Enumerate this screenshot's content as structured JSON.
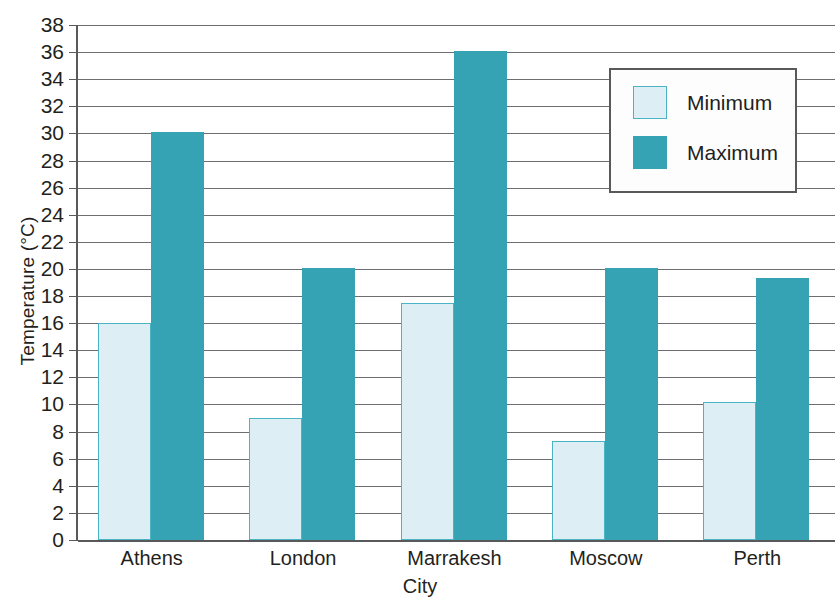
{
  "chart_data": {
    "type": "bar",
    "title": "",
    "xlabel": "City",
    "ylabel": "Temperature (°C)",
    "categories": [
      "Athens",
      "London",
      "Marrakesh",
      "Moscow",
      "Perth"
    ],
    "series": [
      {
        "name": "Minimum",
        "color": "#ddeff4",
        "border_color": "#4bb3c4",
        "values": [
          16.0,
          9.0,
          17.5,
          7.3,
          10.2
        ]
      },
      {
        "name": "Maximum",
        "color": "#36a3b5",
        "border_color": "#36a3b5",
        "values": [
          30.1,
          20.1,
          36.1,
          20.1,
          19.3
        ]
      }
    ],
    "ylim": [
      0,
      38
    ],
    "ytick_step": 2,
    "yticks": [
      0,
      2,
      4,
      6,
      8,
      10,
      12,
      14,
      16,
      18,
      20,
      22,
      24,
      26,
      28,
      30,
      32,
      34,
      36,
      38
    ],
    "grid": true,
    "legend_position": "upper-right",
    "legend_entries": [
      "Minimum",
      "Maximum"
    ]
  },
  "axes": {
    "y_title": "Temperature (°C)",
    "x_title": "City"
  },
  "legend": {
    "items": [
      {
        "label": "Minimum"
      },
      {
        "label": "Maximum"
      }
    ]
  }
}
